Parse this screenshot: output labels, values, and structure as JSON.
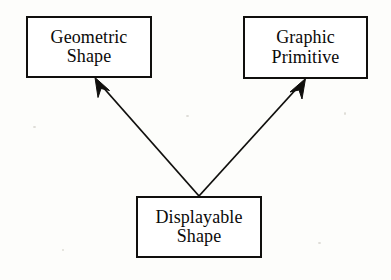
{
  "diagram": {
    "type": "class-inheritance-diagram",
    "background_color": "#fdfdfb",
    "line_color": "#100f0d",
    "box_fill_color": "#ffffff",
    "boxes": [
      {
        "id": "geometric-shape",
        "lines": [
          "Geometric",
          "Shape"
        ],
        "x": 26,
        "y": 16,
        "width": 126,
        "height": 62
      },
      {
        "id": "graphic-primitive",
        "lines": [
          "Graphic",
          "Primitive"
        ],
        "x": 243,
        "y": 16,
        "width": 125,
        "height": 63
      },
      {
        "id": "displayable-shape",
        "lines": [
          "Displayable",
          "Shape"
        ],
        "x": 136,
        "y": 196,
        "width": 126,
        "height": 62
      }
    ],
    "connectors": [
      {
        "id": "displayable-to-geometric",
        "from": "displayable-shape",
        "to": "geometric-shape",
        "arrowhead": "solid-filled",
        "start_x": 199,
        "start_y": 196,
        "end_x": 95,
        "end_y": 78
      },
      {
        "id": "displayable-to-graphic",
        "from": "displayable-shape",
        "to": "graphic-primitive",
        "arrowhead": "solid-filled",
        "start_x": 199,
        "start_y": 196,
        "end_x": 305,
        "end_y": 79
      }
    ]
  }
}
